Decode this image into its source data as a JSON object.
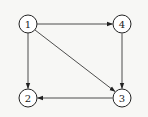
{
  "nodes": [
    {
      "id": "1",
      "label": "1",
      "x": 28,
      "y": 24
    },
    {
      "id": "4",
      "label": "4",
      "x": 122,
      "y": 24
    },
    {
      "id": "2",
      "label": "2",
      "x": 28,
      "y": 98
    },
    {
      "id": "3",
      "label": "3",
      "x": 122,
      "y": 98
    }
  ],
  "edges": [
    {
      "from": "1",
      "to": "4",
      "bidirectional": true
    },
    {
      "from": "1",
      "to": "2",
      "bidirectional": true
    },
    {
      "from": "1",
      "to": "3",
      "bidirectional": false
    },
    {
      "from": "4",
      "to": "3",
      "bidirectional": false
    },
    {
      "from": "3",
      "to": "2",
      "bidirectional": false
    }
  ],
  "colors": {
    "stroke": "#222222",
    "node_fill": "#ffffff",
    "background": "#f7f7f5"
  }
}
